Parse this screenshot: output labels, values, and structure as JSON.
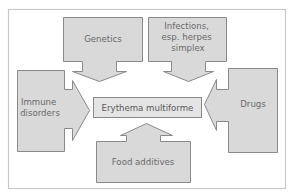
{
  "diagram": {
    "center": {
      "label": "Erythema multiforme"
    },
    "causes": [
      {
        "id": "genetics",
        "lines": [
          "Genetics"
        ],
        "direction": "down"
      },
      {
        "id": "infections",
        "lines": [
          "Infections,",
          "esp. herpes",
          "simplex"
        ],
        "direction": "down"
      },
      {
        "id": "immune",
        "lines": [
          "Immune",
          "disorders"
        ],
        "direction": "right"
      },
      {
        "id": "drugs",
        "lines": [
          "Drugs"
        ],
        "direction": "left"
      },
      {
        "id": "food",
        "lines": [
          "Food additives"
        ],
        "direction": "up"
      }
    ],
    "colors": {
      "shape_fill": "#d9d9d9",
      "shape_stroke": "#8a8a8a",
      "frame_stroke": "#c8c8c8",
      "text": "#6a6a6a"
    }
  }
}
